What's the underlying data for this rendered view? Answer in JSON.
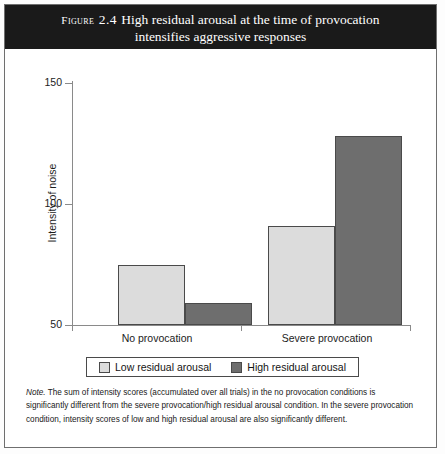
{
  "figure": {
    "label_prefix": "Figure",
    "number": "2.4",
    "title_line1": "High residual arousal at the time of provocation",
    "title_line2": "intensifies aggressive responses"
  },
  "note": {
    "word": "Note.",
    "line1": " The sum of intensity scores (accumulated over all trials) in the no provocation conditions is significantly",
    "line2": "different from the severe provocation/high residual arousal condition. In the severe provocation condition,",
    "line3": "intensity scores of low and high residual arousal are also significantly different."
  },
  "colors": {
    "low": "#dcdcdc",
    "high": "#6e6e6e",
    "title_bg": "#1a1a1a",
    "axis": "#8a8a8a",
    "bar_border": "#4a4a4a"
  },
  "chart_data": {
    "type": "bar",
    "title": "High residual arousal at the time of provocation intensifies aggressive responses",
    "categories": [
      "No provocation",
      "Severe provocation"
    ],
    "series": [
      {
        "name": "Low residual arousal",
        "values": [
          75,
          91
        ]
      },
      {
        "name": "High residual arousal",
        "values": [
          59,
          128
        ]
      }
    ],
    "xlabel": "",
    "ylabel": "Intensity of noise",
    "ylim": [
      50,
      150
    ],
    "yticks": [
      50,
      100,
      150
    ],
    "grid": false,
    "legend_position": "bottom"
  }
}
